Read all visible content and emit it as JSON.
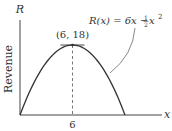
{
  "chart_data": {
    "type": "line",
    "title": "",
    "function_label": "R(x) = 6x − ½ x²",
    "function_parts": {
      "lhs": "R(x) = 6x − ",
      "frac_num": "1",
      "frac_den": "2",
      "tail": " x",
      "exp": "2"
    },
    "xlabel": "x",
    "ylabel": "R",
    "side_label": "Revenue",
    "xlim": [
      0,
      13
    ],
    "ylim": [
      0,
      24
    ],
    "x_ticks": [
      {
        "value": 6,
        "label": "6"
      }
    ],
    "curve": {
      "a": -0.5,
      "b": 6,
      "c": 0,
      "x_start": 0,
      "x_end": 12
    },
    "annotation": {
      "x": 6,
      "y": 18,
      "label": "(6, 18)"
    },
    "grid": false
  }
}
